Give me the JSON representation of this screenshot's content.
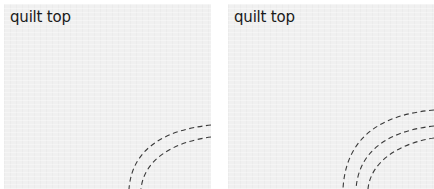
{
  "panels": [
    {
      "label": "quilt top",
      "seam_lines": 2,
      "line_style": "dashed"
    },
    {
      "label": "quilt top",
      "seam_lines": 3,
      "line_style": "dashed"
    }
  ],
  "colors": {
    "panel_background": "#f0f0f0",
    "page_background": "#ffffff",
    "seam_stroke": "#3a3a3a",
    "label_text": "#1a1a1a"
  }
}
